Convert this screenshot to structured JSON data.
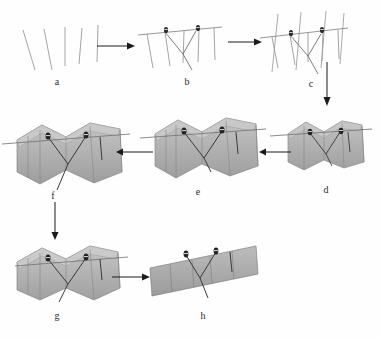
{
  "figure": {
    "type": "workflow-diagram",
    "title": "",
    "width": 380,
    "height": 338,
    "background": "#fefefe",
    "colors": {
      "line": "#8a8a8a",
      "line_dark": "#6d6d6d",
      "marker": "#2a2a2a",
      "arrow": "#1a1a1a",
      "label": "#2b2b2b",
      "slab_front": "#a8a8a8",
      "slab_top": "#c3c3c3",
      "slab_side": "#9a9a9a",
      "slab_edge": "#7c7c7c",
      "slab_light": "#b8b8b8"
    },
    "panels": [
      {
        "id": "a",
        "label": "a",
        "label_x": 57,
        "label_y": 82,
        "x": 18,
        "y": 22,
        "w": 86,
        "h": 56,
        "kind": "well-log-lines",
        "description": "five unconnected near-vertical well trace lines",
        "lines": [
          {
            "x1": 5,
            "y1": 8,
            "x2": 17,
            "y2": 48
          },
          {
            "x1": 26,
            "y1": 7,
            "x2": 34,
            "y2": 48
          },
          {
            "x1": 47,
            "y1": 5,
            "x2": 47,
            "y2": 44
          },
          {
            "x1": 64,
            "y1": 6,
            "x2": 61,
            "y2": 42
          },
          {
            "x1": 80,
            "y1": 3,
            "x2": 79,
            "y2": 40
          }
        ]
      },
      {
        "id": "b",
        "label": "b",
        "label_x": 187,
        "label_y": 82,
        "x": 136,
        "y": 18,
        "w": 88,
        "h": 60,
        "kind": "correlated-section",
        "description": "well traces joined by a horizontal datum line with two drill-rig markers and a V-shaped fault trace",
        "datum": {
          "x1": 2,
          "y1": 17,
          "x2": 86,
          "y2": 9
        },
        "wells": [
          {
            "x1": 11,
            "y1": 16,
            "x2": 17,
            "y2": 50
          },
          {
            "x1": 29,
            "y1": 14,
            "x2": 34,
            "y2": 48
          },
          {
            "x1": 48,
            "y1": 13,
            "x2": 47,
            "y2": 45
          },
          {
            "x1": 63,
            "y1": 12,
            "x2": 62,
            "y2": 44
          },
          {
            "x1": 78,
            "y1": 10,
            "x2": 79,
            "y2": 42
          }
        ],
        "fault": [
          {
            "x1": 29,
            "y1": 14,
            "x2": 47,
            "y2": 36
          },
          {
            "x1": 47,
            "y1": 36,
            "x2": 60,
            "y2": 13
          },
          {
            "x1": 47,
            "y1": 36,
            "x2": 56,
            "y2": 52
          }
        ],
        "markers": [
          {
            "x": 30,
            "y": 13
          },
          {
            "x": 62,
            "y": 11
          }
        ]
      },
      {
        "id": "c",
        "label": "c",
        "label_x": 311,
        "label_y": 84,
        "x": 258,
        "y": 10,
        "w": 92,
        "h": 66,
        "kind": "cross-sections-grid",
        "description": "correlated section with additional crossing section lines forming a fence framework",
        "datum": {
          "x1": 2,
          "y1": 28,
          "x2": 90,
          "y2": 18
        },
        "wells": [
          {
            "x1": 14,
            "y1": 27,
            "x2": 20,
            "y2": 58
          },
          {
            "x1": 32,
            "y1": 25,
            "x2": 37,
            "y2": 55
          },
          {
            "x1": 50,
            "y1": 23,
            "x2": 50,
            "y2": 52
          },
          {
            "x1": 65,
            "y1": 22,
            "x2": 64,
            "y2": 51
          },
          {
            "x1": 80,
            "y1": 20,
            "x2": 81,
            "y2": 49
          }
        ],
        "crossing": [
          {
            "x1": 20,
            "y1": 4,
            "x2": 14,
            "y2": 62
          },
          {
            "x1": 43,
            "y1": 2,
            "x2": 38,
            "y2": 60
          },
          {
            "x1": 68,
            "y1": 1,
            "x2": 63,
            "y2": 58
          },
          {
            "x1": 86,
            "y1": 3,
            "x2": 82,
            "y2": 54
          }
        ],
        "fault": [
          {
            "x1": 32,
            "y1": 25,
            "x2": 50,
            "y2": 46
          },
          {
            "x1": 50,
            "y1": 46,
            "x2": 63,
            "y2": 24
          },
          {
            "x1": 50,
            "y1": 46,
            "x2": 60,
            "y2": 64
          }
        ],
        "markers": [
          {
            "x": 33,
            "y": 24
          },
          {
            "x": 64,
            "y": 21
          }
        ]
      },
      {
        "id": "d",
        "label": "d",
        "label_x": 326,
        "label_y": 190,
        "x": 284,
        "y": 112,
        "w": 88,
        "h": 70,
        "kind": "slab-3d",
        "description": "first gridded 3D surface slab built from the fence sections",
        "slab_scale": 0.78
      },
      {
        "id": "e",
        "label": "e",
        "label_x": 198,
        "label_y": 192,
        "x": 152,
        "y": 110,
        "w": 112,
        "h": 84,
        "kind": "slab-3d",
        "description": "expanded 3D surface slab",
        "slab_scale": 1.0
      },
      {
        "id": "f",
        "label": "f",
        "label_x": 53,
        "label_y": 196,
        "x": 14,
        "y": 114,
        "w": 116,
        "h": 86,
        "kind": "slab-3d",
        "description": "refined 3D surface slab",
        "slab_scale": 1.03
      },
      {
        "id": "g",
        "label": "g",
        "label_x": 57,
        "label_y": 316,
        "x": 14,
        "y": 240,
        "w": 114,
        "h": 76,
        "kind": "slab-3d",
        "description": "final smoothed 3D surface slab",
        "slab_scale": 1.0
      },
      {
        "id": "h",
        "label": "h",
        "label_x": 203,
        "label_y": 316,
        "x": 148,
        "y": 242,
        "w": 112,
        "h": 66,
        "kind": "unfolded-panel",
        "description": "restored / unfolded flat panel of the surface"
      }
    ],
    "arrows": [
      {
        "id": "a-to-b",
        "from": "a",
        "to": "b",
        "dir": "right",
        "x1": 97,
        "y1": 46,
        "x2": 133,
        "y2": 46
      },
      {
        "id": "b-to-c",
        "from": "b",
        "to": "c",
        "dir": "right",
        "x1": 228,
        "y1": 42,
        "x2": 260,
        "y2": 42
      },
      {
        "id": "c-to-d",
        "from": "c",
        "to": "d",
        "dir": "down",
        "x1": 327,
        "y1": 64,
        "x2": 327,
        "y2": 106
      },
      {
        "id": "d-to-e",
        "from": "d",
        "to": "e",
        "dir": "left",
        "x1": 288,
        "y1": 152,
        "x2": 262,
        "y2": 152
      },
      {
        "id": "e-to-f",
        "from": "e",
        "to": "f",
        "dir": "left",
        "x1": 150,
        "y1": 152,
        "x2": 118,
        "y2": 152
      },
      {
        "id": "f-to-g",
        "from": "f",
        "to": "g",
        "dir": "down",
        "x1": 55,
        "y1": 203,
        "x2": 55,
        "y2": 239
      },
      {
        "id": "g-to-h",
        "from": "g",
        "to": "h",
        "dir": "right",
        "x1": 112,
        "y1": 277,
        "x2": 148,
        "y2": 277
      }
    ]
  }
}
